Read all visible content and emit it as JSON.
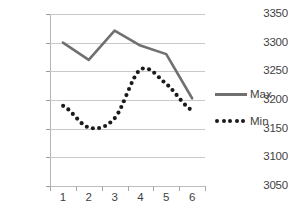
{
  "chart_data": {
    "type": "line",
    "title": "",
    "xlabel": "",
    "ylabel": "",
    "categories": [
      "1",
      "2",
      "3",
      "4",
      "5",
      "6"
    ],
    "ylim": [
      3050,
      3350
    ],
    "yticks": [
      3050,
      3100,
      3150,
      3200,
      3250,
      3300,
      3350
    ],
    "ytick_labels": [
      "3050",
      "3100",
      "3150",
      "3200",
      "3250",
      "3300",
      "3350"
    ],
    "grid": true,
    "legend_position": "right",
    "series": [
      {
        "name": "Max",
        "style": "solid",
        "color": "#707070",
        "values": [
          3300,
          3270,
          3321,
          3295,
          3280,
          3203
        ]
      },
      {
        "name": "Min",
        "style": "dotted",
        "color": "#1a1a1a",
        "values": [
          3190,
          3152,
          3168,
          3253,
          3228,
          3182
        ]
      }
    ]
  },
  "legend": {
    "entries": [
      {
        "label": "Max",
        "key": "solid-line-swatch"
      },
      {
        "label": "Min",
        "key": "dotted-line-swatch"
      }
    ]
  },
  "axes": {
    "y_axis_name": "value-axis",
    "x_axis_name": "category-axis"
  }
}
